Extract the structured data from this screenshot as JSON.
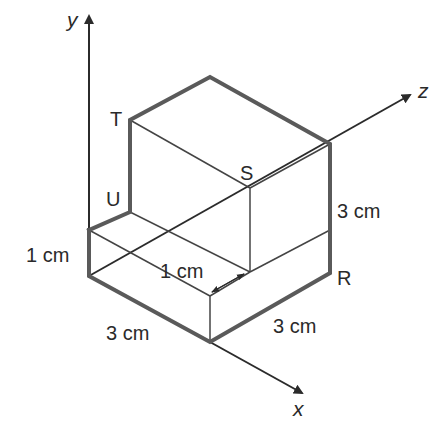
{
  "figure": {
    "type": "isometric-solid-diagram",
    "axes": {
      "x": "x",
      "y": "y",
      "z": "z"
    },
    "vertex_labels": {
      "T": "T",
      "U": "U",
      "S": "S",
      "R": "R"
    },
    "dimensions": {
      "left_height": "1 cm",
      "step_depth": "1 cm",
      "front_width": "3 cm",
      "right_width": "3 cm",
      "right_height": "3 cm"
    },
    "colors": {
      "edge": "#5a5a5a",
      "line": "#444444",
      "axis": "#2b2b2b",
      "text": "#2a2a2a",
      "background": "#ffffff"
    }
  }
}
